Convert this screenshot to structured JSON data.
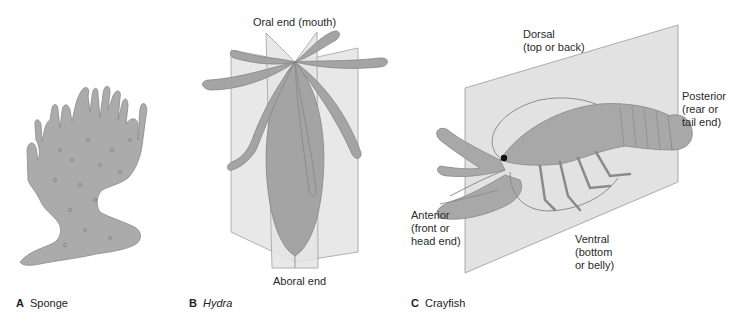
{
  "figure": {
    "panels": [
      {
        "letter": "A",
        "name": "Sponge",
        "italic": false,
        "symmetry": "asymmetry"
      },
      {
        "letter": "B",
        "name": "Hydra",
        "italic": true,
        "symmetry": "radial"
      },
      {
        "letter": "C",
        "name": "Crayfish",
        "italic": false,
        "symmetry": "bilateral"
      }
    ],
    "hydra_labels": {
      "oral": "Oral end (mouth)",
      "aboral": "Aboral end"
    },
    "crayfish_labels": {
      "dorsal": "Dorsal\n(top or back)",
      "posterior": "Posterior\n(rear or\ntail end)",
      "anterior": "Anterior\n(front or\nhead end)",
      "ventral": "Ventral\n(bottom\nor belly)"
    },
    "colors": {
      "organism_fill": "#a9a9a9",
      "plane_fill": "#e2e2e2",
      "plane_stroke": "#9a9a9a",
      "text": "#222222"
    }
  }
}
